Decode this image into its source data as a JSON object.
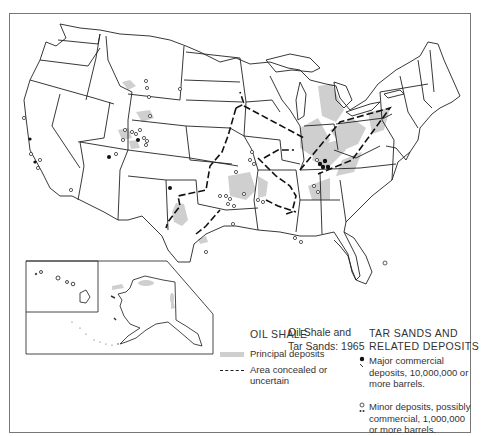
{
  "map": {
    "title_line1": "Oil Shale and",
    "title_line2": "Tar Sands:  1965",
    "colors": {
      "principal_deposits": "#cfcfcf",
      "state_lines": "#222222",
      "frame": "#777777"
    }
  },
  "legend": {
    "oil_shale": {
      "heading": "OIL SHALE",
      "items": [
        {
          "symbol": "gray-fill",
          "label": "Principal deposits"
        },
        {
          "symbol": "dashed-line",
          "label_line1": "Area concealed or",
          "label_line2": "uncertain"
        }
      ]
    },
    "tar_sands": {
      "heading_line1": "TAR SANDS AND",
      "heading_line2": "RELATED DEPOSITS",
      "items": [
        {
          "symbol": "filled-dot",
          "label_line1": "Major commercial",
          "label_line2": "deposits, 10,000,000 or",
          "label_line3": "more barrels."
        },
        {
          "symbol": "open-circle",
          "label_line1": "Minor deposits, possibly",
          "label_line2": "commercial, 1,000,000",
          "label_line3": "or more barrels."
        }
      ]
    }
  },
  "insets": [
    "Alaska",
    "Hawaii"
  ]
}
